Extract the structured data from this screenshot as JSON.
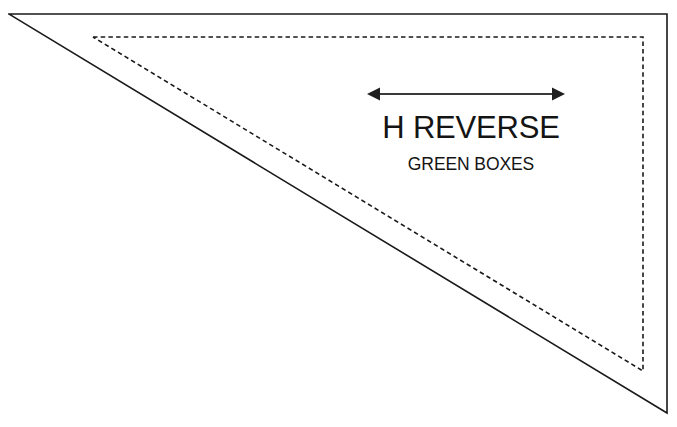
{
  "diagram": {
    "title": "H REVERSE",
    "subtitle": "GREEN BOXES",
    "background_color": "#ffffff",
    "line_color": "#1a1a1a",
    "arrow_color": "#3a3a3a",
    "shapes": {
      "solid_triangle": {
        "name": "solid-triangle",
        "style": "solid",
        "stroke_width": 1.6,
        "points": "9,14 667,14 667,413"
      },
      "dashed_triangle": {
        "name": "dashed-triangle",
        "style": "dashed",
        "stroke_width": 1.6,
        "dash_pattern": "4.5 3.2",
        "points": "93,37 643,37 643,371"
      }
    },
    "arrow": {
      "name": "double-headed-horizontal-arrow",
      "direction": "both",
      "x_start": 367,
      "x_end": 565,
      "y": 94,
      "stroke_width": 2.1,
      "head_length": 13,
      "head_width": 13
    }
  }
}
